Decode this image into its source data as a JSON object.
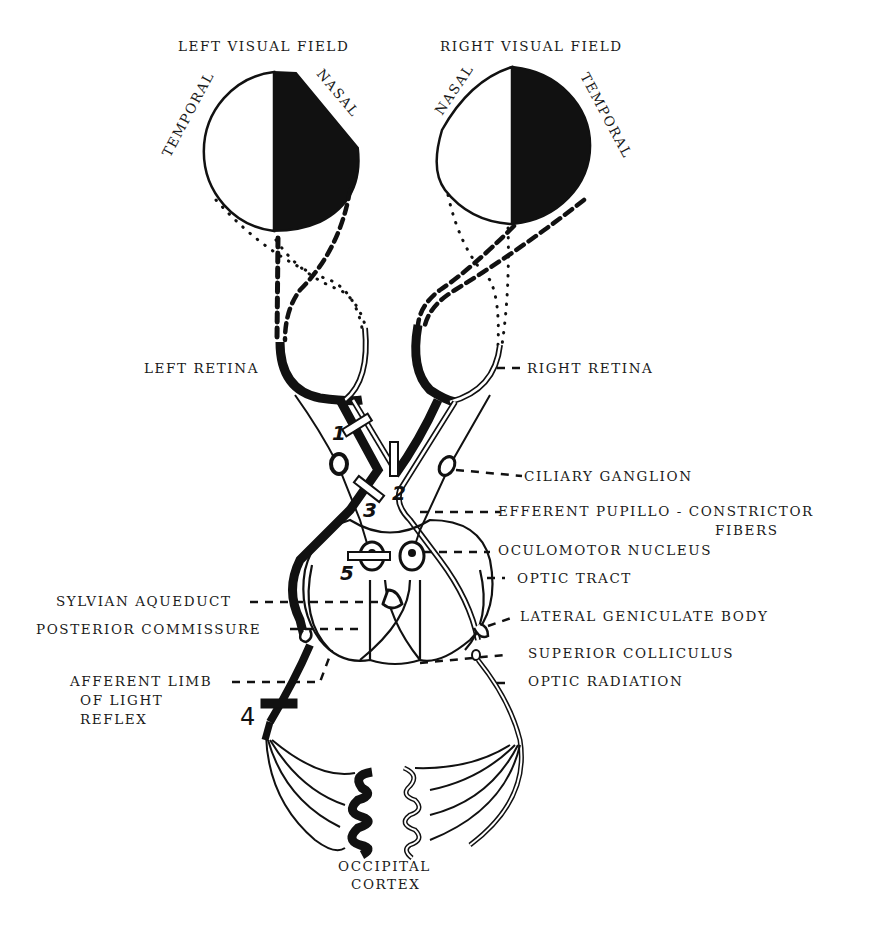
{
  "diagram": {
    "colors": {
      "ink": "#111111",
      "background": "#ffffff"
    },
    "visual_fields": [
      {
        "id": "left",
        "title": "LEFT VISUAL FIELD",
        "left_label": "TEMPORAL",
        "right_label": "NASAL",
        "shaded_half": "right"
      },
      {
        "id": "right",
        "title": "RIGHT VISUAL FIELD",
        "left_label": "NASAL",
        "right_label": "TEMPORAL",
        "shaded_half": "right"
      }
    ],
    "labels": {
      "left_retina": "LEFT RETINA",
      "right_retina": "RIGHT RETINA",
      "ciliary_ganglion": "CILIARY GANGLION",
      "efferent_line1": "EFFERENT PUPILLO - CONSTRICTOR",
      "efferent_line2": "FIBERS",
      "oculomotor_nucleus": "OCULOMOTOR NUCLEUS",
      "optic_tract": "OPTIC TRACT",
      "sylvian_aqueduct": "SYLVIAN AQUEDUCT",
      "lateral_geniculate_body": "LATERAL GENICULATE BODY",
      "posterior_commissure": "POSTERIOR COMMISSURE",
      "superior_colliculus": "SUPERIOR COLLICULUS",
      "afferent_line1": "AFFERENT LIMB",
      "afferent_line2": "OF LIGHT",
      "afferent_line3": "REFLEX",
      "optic_radiation": "OPTIC RADIATION",
      "occipital_line1": "OCCIPITAL",
      "occipital_line2": "CORTEX"
    },
    "lesion_markers": [
      "1",
      "2",
      "3",
      "4",
      "5"
    ]
  }
}
